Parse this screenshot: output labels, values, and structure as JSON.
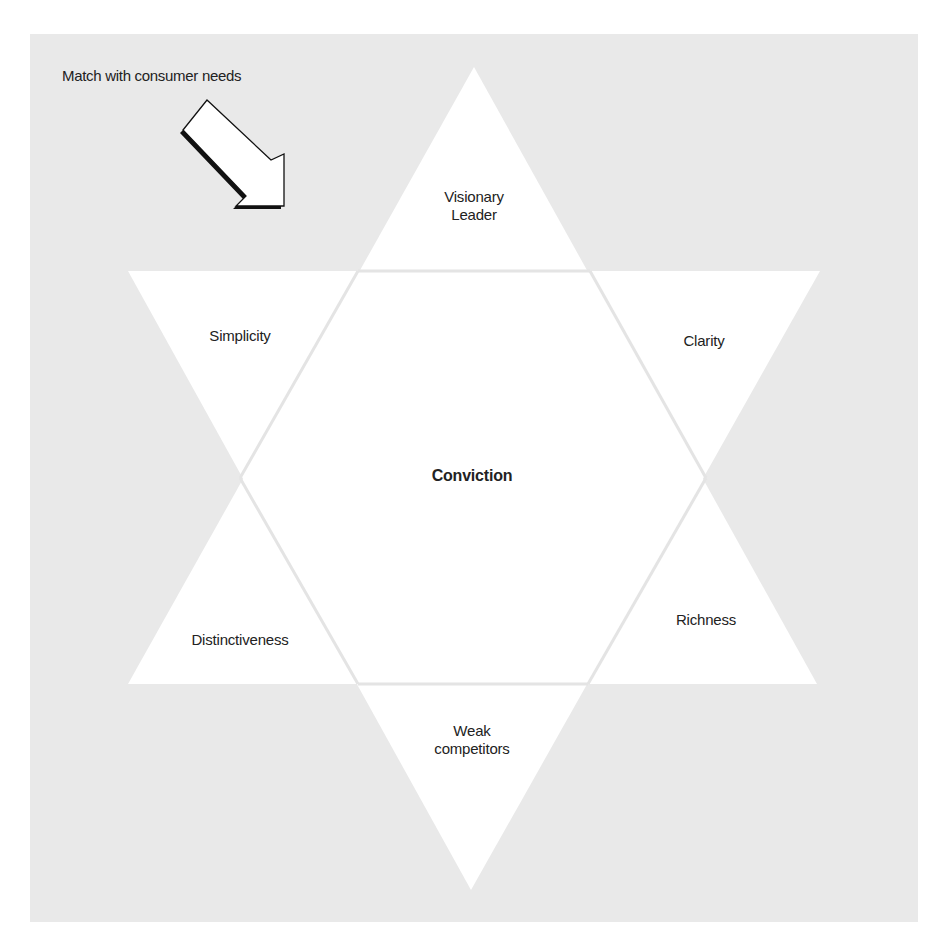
{
  "diagram": {
    "caption": "Match with consumer needs",
    "center": "Conviction",
    "points": {
      "top": [
        "Visionary",
        "Leader"
      ],
      "upper_left": "Simplicity",
      "upper_right": "Clarity",
      "lower_left": "Distinctiveness",
      "lower_right": "Richness",
      "bottom": [
        "Weak",
        "competitors"
      ]
    },
    "icons": {
      "arrow": "arrow-down-right-icon"
    },
    "colors": {
      "panel": "#e9e9e9",
      "shape": "#ffffff",
      "separator": "#e6e6e6",
      "text": "#222222"
    }
  }
}
